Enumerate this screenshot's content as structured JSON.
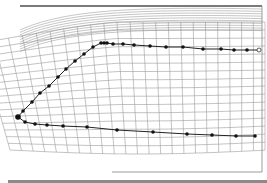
{
  "figure": {
    "type": "wireframe-mesh-with-path",
    "colors": {
      "background": "#ffffff",
      "mesh": "#9a9a9a",
      "path": "#222222",
      "points": "#111111",
      "frame": "#9c9c9c"
    },
    "upper_path": [
      [
        18,
        117
      ],
      [
        23,
        111
      ],
      [
        32,
        102
      ],
      [
        40,
        93
      ],
      [
        49,
        86
      ],
      [
        58,
        77
      ],
      [
        66,
        69
      ],
      [
        75,
        61
      ],
      [
        84,
        54
      ],
      [
        93,
        47
      ],
      [
        101,
        43
      ],
      [
        104,
        43
      ],
      [
        107,
        43
      ],
      [
        113,
        44
      ],
      [
        123,
        44
      ],
      [
        134,
        45
      ],
      [
        150,
        46
      ],
      [
        166,
        47
      ],
      [
        183,
        47
      ],
      [
        203,
        49
      ],
      [
        221,
        49
      ],
      [
        234,
        50
      ],
      [
        247,
        50
      ]
    ],
    "upper_end_hollow": [
      259,
      50
    ],
    "lower_path": [
      [
        18,
        117
      ],
      [
        25,
        122
      ],
      [
        35,
        124
      ],
      [
        47,
        125
      ],
      [
        63,
        126
      ],
      [
        87,
        127
      ],
      [
        117,
        130
      ],
      [
        153,
        132
      ],
      [
        187,
        134
      ],
      [
        212,
        135
      ],
      [
        236,
        136
      ],
      [
        255,
        136
      ]
    ]
  }
}
